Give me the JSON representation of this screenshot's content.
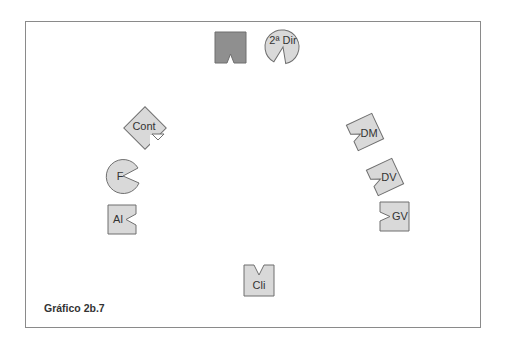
{
  "caption": "Gráfico 2b.7",
  "colors": {
    "frame": "#8a8a8a",
    "shape_fill": "#d9d9d9",
    "shape_dark_fill": "#8f8f8f",
    "stroke": "#6f6f6f",
    "text": "#333333"
  },
  "seats": [
    {
      "id": "presidency",
      "label": "",
      "shape": "square-dark",
      "notch": "bottom"
    },
    {
      "id": "2dir",
      "label": "2ª Dir",
      "shape": "circle",
      "notch": "down-left"
    },
    {
      "id": "cont",
      "label": "Cont",
      "shape": "square-rotated",
      "notch": "lower-right"
    },
    {
      "id": "f",
      "label": "F",
      "shape": "circle",
      "notch": "right"
    },
    {
      "id": "al",
      "label": "Al",
      "shape": "square",
      "notch": "right"
    },
    {
      "id": "dm",
      "label": "DM",
      "shape": "square-rotated",
      "notch": "left"
    },
    {
      "id": "dv",
      "label": "DV",
      "shape": "square-rotated",
      "notch": "left"
    },
    {
      "id": "gv",
      "label": "GV",
      "shape": "square",
      "notch": "left"
    },
    {
      "id": "cli",
      "label": "Cli",
      "shape": "square",
      "notch": "top"
    }
  ]
}
